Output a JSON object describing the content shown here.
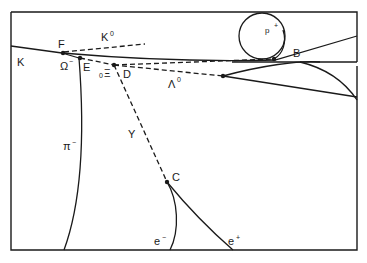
{
  "diagram": {
    "labels": {
      "K": "K",
      "F": "F",
      "K0": "K",
      "K0_sup": "0",
      "Omega": "Ω",
      "Omega_sup": "−",
      "E": "E",
      "Xi": "Ξ",
      "Xi_pre": "0",
      "D": "D",
      "Lambda": "Λ",
      "Lambda_sup": "0",
      "gamma": "Y",
      "pi": "π",
      "pi_sup": "−",
      "C": "C",
      "e_minus": "e",
      "e_minus_sup": "−",
      "e_plus": "e",
      "e_plus_sup": "+",
      "B": "B",
      "p": "p",
      "p_sup": "+"
    },
    "vertices": [
      "F",
      "E",
      "D",
      "C",
      "B",
      "Lambda-decay"
    ],
    "colors": {
      "ink": "#1a1a1a",
      "background": "#ffffff"
    }
  }
}
